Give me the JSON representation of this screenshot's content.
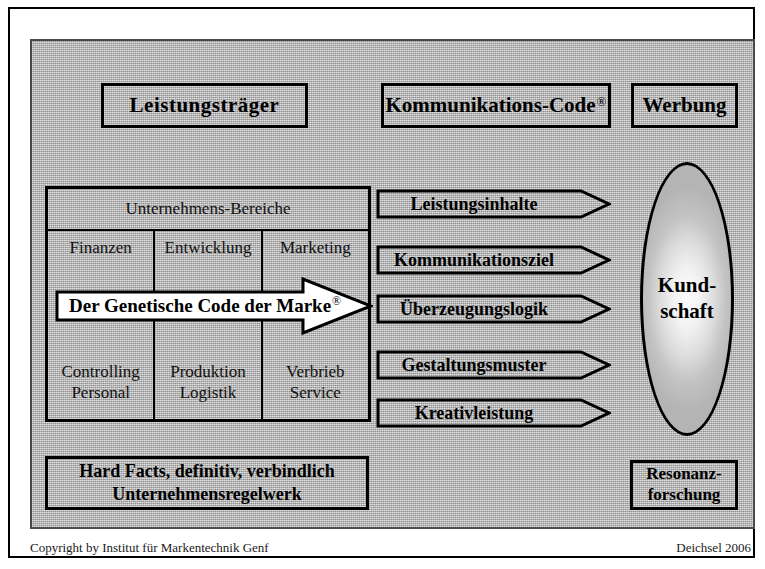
{
  "figure": {
    "title_boxes": [
      {
        "id": "leistungstraeger",
        "label": "Leistungsträger"
      },
      {
        "id": "kommunikations-code",
        "label": "Kommunikations-Code",
        "registered": "®"
      },
      {
        "id": "werbung",
        "label": "Werbung"
      }
    ],
    "company_table": {
      "header": "Unternehmens-Bereiche",
      "columns": [
        {
          "top": "Finanzen",
          "bottom_line1": "Controlling",
          "bottom_line2": "Personal"
        },
        {
          "top": "Entwicklung",
          "bottom_line1": "Produktion",
          "bottom_line2": "Logistik"
        },
        {
          "top": "Marketing",
          "bottom_line1": "Verbrieb",
          "bottom_line2": "Service"
        }
      ]
    },
    "genetic_code_arrow": {
      "label": "Der Genetische Code der Marke",
      "registered": "®"
    },
    "chevrons": [
      {
        "id": "leistungsinhalte",
        "label": "Leistungsinhalte"
      },
      {
        "id": "kommunikationsziel",
        "label": "Kommunikationsziel"
      },
      {
        "id": "ueberzeugungslogik",
        "label": "Überzeugungslogik"
      },
      {
        "id": "gestaltungsmuster",
        "label": "Gestaltungsmuster"
      },
      {
        "id": "kreativleistung",
        "label": "Kreativleistung"
      }
    ],
    "ellipse": {
      "line1": "Kund-",
      "line2": "schaft"
    },
    "bottom_boxes": {
      "hard_facts_line1": "Hard Facts, definitiv, verbindlich",
      "hard_facts_line2": "Unternehmensregelwerk",
      "resonanz_line1": "Resonanz-",
      "resonanz_line2": "forschung"
    },
    "footer": {
      "left": "Copyright by Institut für Markentechnik Genf",
      "right": "Deichsel  2006"
    },
    "colors": {
      "panel_background": "#b9b9b9",
      "stroke": "#000000",
      "arrow_fill": "#ffffff",
      "page_background": "#ffffff"
    }
  }
}
